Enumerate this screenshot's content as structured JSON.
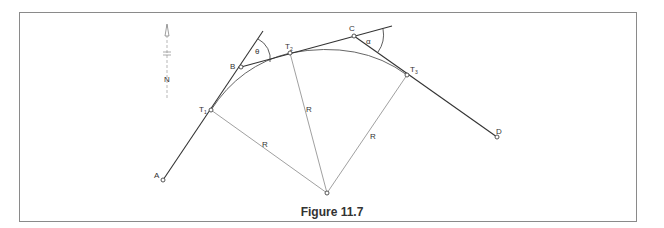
{
  "figure": {
    "caption": "Figure 11.7",
    "north_label": "N",
    "points": {
      "A": "A",
      "B": "B",
      "C": "C",
      "D": "D",
      "T1": "T",
      "T1_sub": "1",
      "T2": "T",
      "T2_sub": "2",
      "T3": "T",
      "T3_sub": "3"
    },
    "radius_labels": [
      "R",
      "R",
      "R"
    ],
    "angles": {
      "theta": "θ",
      "alpha": "α"
    },
    "colors": {
      "line_dark": "#333333",
      "line_light": "#888888",
      "frame": "#8a8a8a"
    }
  }
}
